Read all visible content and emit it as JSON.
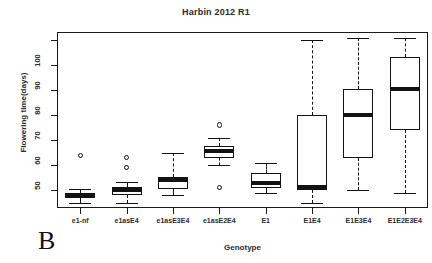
{
  "chart_data": {
    "type": "box",
    "title": "Harbin 2012 R1",
    "xlabel": "Genotype",
    "ylabel": "Flowering time(days)",
    "panel_label": "B",
    "grid": false,
    "legend": null,
    "ylim": [
      43,
      113
    ],
    "yticks": [
      50,
      60,
      70,
      80,
      90,
      100,
      110
    ],
    "ytick_labels": [
      "50",
      "60",
      "70",
      "80",
      "90",
      "100",
      ""
    ],
    "categories": [
      "e1-nf",
      "e1asE4",
      "e1asE3E4",
      "e1asE2E4",
      "E1",
      "E1E4",
      "E1E3E4",
      "E1E2E3E4"
    ],
    "boxes": [
      {
        "category": "e1-nf",
        "whisker_low": 45.0,
        "q1": 47.0,
        "median": 48.0,
        "q3": 49.0,
        "whisker_high": 50.5,
        "outliers": [
          64.0
        ]
      },
      {
        "category": "e1asE4",
        "whisker_low": 45.0,
        "q1": 48.0,
        "median": 50.0,
        "q3": 51.5,
        "whisker_high": 53.5,
        "outliers": [
          59.0,
          63.0
        ]
      },
      {
        "category": "e1asE3E4",
        "whisker_low": 48.0,
        "q1": 50.5,
        "median": 54.0,
        "q3": 55.5,
        "whisker_high": 65.0,
        "outliers": []
      },
      {
        "category": "e1asE2E4",
        "whisker_low": 60.0,
        "q1": 63.0,
        "median": 65.5,
        "q3": 67.5,
        "whisker_high": 71.0,
        "outliers": [
          51.0,
          76.0
        ]
      },
      {
        "category": "E1",
        "whisker_low": 49.0,
        "q1": 51.0,
        "median": 53.0,
        "q3": 57.0,
        "whisker_high": 61.0,
        "outliers": []
      },
      {
        "category": "E1E4",
        "whisker_low": 45.0,
        "q1": 50.0,
        "median": 51.5,
        "q3": 80.0,
        "whisker_high": 110.0,
        "outliers": []
      },
      {
        "category": "E1E3E4",
        "whisker_low": 50.0,
        "q1": 63.0,
        "median": 80.0,
        "q3": 90.5,
        "whisker_high": 110.5,
        "outliers": []
      },
      {
        "category": "E1E2E3E4",
        "whisker_low": 49.0,
        "q1": 74.0,
        "median": 90.5,
        "q3": 103.0,
        "whisker_high": 110.5,
        "outliers": []
      }
    ]
  }
}
